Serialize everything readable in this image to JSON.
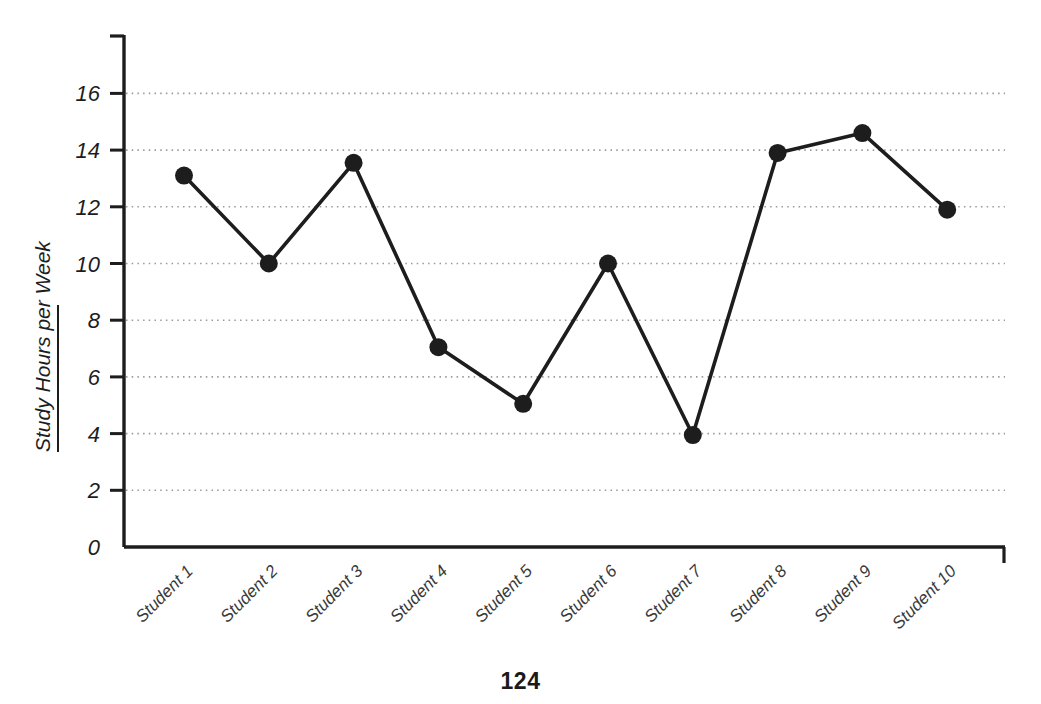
{
  "page": {
    "number": "124",
    "background_color": "#ffffff"
  },
  "chart_data": {
    "type": "line",
    "title": "",
    "subtitle": "",
    "xlabel": "",
    "ylabel": "Study Hours per Week",
    "categories": [
      "Student 1",
      "Student 2",
      "Student 3",
      "Student 4",
      "Student 5",
      "Student 6",
      "Student 7",
      "Student 8",
      "Student 9",
      "Student 10"
    ],
    "values": [
      13.1,
      10.0,
      13.55,
      7.05,
      5.05,
      10.0,
      3.95,
      13.9,
      14.6,
      11.9
    ],
    "ylim": [
      0,
      17.9
    ],
    "y_ticks": [
      0,
      2,
      4,
      6,
      8,
      10,
      12,
      14,
      16
    ],
    "y_tick_labels": [
      "0",
      "2",
      "4",
      "6",
      "8",
      "10",
      "12",
      "14",
      "16"
    ],
    "grid": {
      "horizontal": true,
      "vertical": false,
      "style": "dotted",
      "color": "#9a9a9a"
    },
    "legend": {
      "visible": false,
      "position": "none",
      "entries": []
    },
    "series": [
      {
        "name": "Study Hours per Week",
        "line_color": "#1d1d1d",
        "marker": "circle",
        "marker_color": "#1d1d1d",
        "values": [
          13.1,
          10.0,
          13.55,
          7.05,
          5.05,
          10.0,
          3.95,
          13.9,
          14.6,
          11.9
        ]
      }
    ],
    "axis_color": "#1d1d1d",
    "x_tick_label_rotation": -45,
    "y_axis_label_rotation": -90
  }
}
